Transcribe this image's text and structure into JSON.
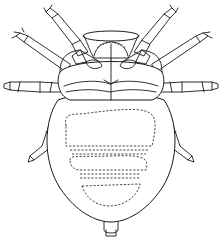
{
  "figure": {
    "subject": "Mite, ventral view (line drawing)",
    "style": "black ink line illustration on white",
    "colors": {
      "ink": "#1a1a1a",
      "background": "#ffffff"
    },
    "parts": {
      "gnathosoma": "mouthparts (capitulum)",
      "legs": "4 pairs of segmented legs",
      "idiosoma": "rounded opisthosoma",
      "markings": "dashed internal outlines on abdomen",
      "anal_tubercle": "small posterior projection"
    }
  }
}
